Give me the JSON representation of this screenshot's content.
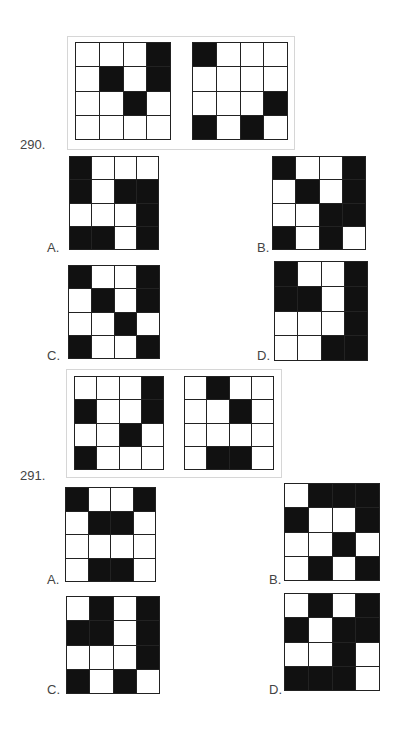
{
  "questions": [
    {
      "number": "290.",
      "question_grids": [
        [
          [
            0,
            0,
            0,
            1
          ],
          [
            0,
            1,
            0,
            1
          ],
          [
            0,
            0,
            1,
            0
          ],
          [
            0,
            0,
            0,
            0
          ]
        ],
        [
          [
            1,
            0,
            0,
            0
          ],
          [
            0,
            0,
            0,
            0
          ],
          [
            0,
            0,
            0,
            1
          ],
          [
            1,
            0,
            1,
            0
          ]
        ]
      ],
      "options": [
        {
          "label": "A.",
          "grid": [
            [
              1,
              0,
              0,
              0
            ],
            [
              1,
              0,
              1,
              1
            ],
            [
              0,
              0,
              0,
              1
            ],
            [
              1,
              1,
              0,
              1
            ]
          ]
        },
        {
          "label": "B.",
          "grid": [
            [
              1,
              0,
              0,
              1
            ],
            [
              0,
              1,
              0,
              1
            ],
            [
              0,
              0,
              1,
              1
            ],
            [
              1,
              0,
              1,
              0
            ]
          ]
        },
        {
          "label": "C.",
          "grid": [
            [
              1,
              0,
              0,
              1
            ],
            [
              0,
              1,
              0,
              1
            ],
            [
              0,
              0,
              1,
              0
            ],
            [
              1,
              0,
              0,
              1
            ]
          ]
        },
        {
          "label": "D.",
          "grid": [
            [
              1,
              0,
              0,
              1
            ],
            [
              1,
              1,
              0,
              1
            ],
            [
              0,
              0,
              0,
              1
            ],
            [
              0,
              0,
              1,
              1
            ]
          ]
        }
      ]
    },
    {
      "number": "291.",
      "question_grids": [
        [
          [
            0,
            0,
            0,
            1
          ],
          [
            1,
            0,
            0,
            1
          ],
          [
            0,
            0,
            1,
            0
          ],
          [
            1,
            0,
            0,
            0
          ]
        ],
        [
          [
            0,
            1,
            0,
            0
          ],
          [
            0,
            0,
            1,
            0
          ],
          [
            0,
            0,
            0,
            0
          ],
          [
            0,
            1,
            1,
            0
          ]
        ]
      ],
      "options": [
        {
          "label": "A.",
          "grid": [
            [
              1,
              0,
              0,
              1
            ],
            [
              0,
              1,
              1,
              0
            ],
            [
              0,
              0,
              0,
              0
            ],
            [
              0,
              1,
              1,
              0
            ]
          ]
        },
        {
          "label": "B.",
          "grid": [
            [
              0,
              1,
              1,
              1
            ],
            [
              1,
              0,
              0,
              1
            ],
            [
              0,
              0,
              1,
              0
            ],
            [
              0,
              1,
              0,
              1
            ]
          ]
        },
        {
          "label": "C.",
          "grid": [
            [
              0,
              1,
              0,
              1
            ],
            [
              1,
              1,
              0,
              1
            ],
            [
              0,
              0,
              0,
              1
            ],
            [
              1,
              0,
              1,
              0
            ]
          ]
        },
        {
          "label": "D.",
          "grid": [
            [
              0,
              1,
              0,
              1
            ],
            [
              1,
              0,
              1,
              1
            ],
            [
              0,
              0,
              1,
              0
            ],
            [
              1,
              1,
              1,
              0
            ]
          ]
        }
      ]
    }
  ]
}
